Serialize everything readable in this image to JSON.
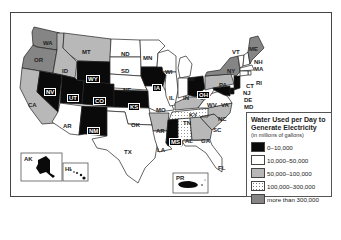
{
  "legend": {
    "title": "Water Used per Day to Generate Electricity",
    "title_line1": "Water Used per Day to",
    "title_line2": "Generate Electricity",
    "subtitle": "(in millions of gallons)",
    "categories": [
      {
        "label": "0–10,000",
        "color": "#0a0a0a"
      },
      {
        "label": "10,000–50,000",
        "color": "#ffffff"
      },
      {
        "label": "50,000–100,000",
        "color": "#b8b8b8"
      },
      {
        "label": "100,000–300,000",
        "color": "dotted"
      },
      {
        "label": "more than 300,000",
        "color": "#858585"
      }
    ]
  },
  "states": {
    "WA": {
      "label": "WA",
      "category": 4
    },
    "OR": {
      "label": "OR",
      "category": 4
    },
    "CA": {
      "label": "CA",
      "category": 2
    },
    "ID": {
      "label": "ID",
      "category": 2
    },
    "MT": {
      "label": "MT",
      "category": 2
    },
    "NV": {
      "label": "NV",
      "category": 0
    },
    "UT": {
      "label": "UT",
      "category": 0
    },
    "WY": {
      "label": "WY",
      "category": 0
    },
    "CO": {
      "label": "CO",
      "category": 0
    },
    "AZ": {
      "label": "AR",
      "category": 1
    },
    "NM": {
      "label": "NM",
      "category": 0
    },
    "ND": {
      "label": "ND",
      "category": 1
    },
    "SD": {
      "label": "SD",
      "category": 1
    },
    "NE": {
      "label": "NE",
      "category": 1
    },
    "KS": {
      "label": "KS",
      "category": 0
    },
    "OK": {
      "label": "OK",
      "category": 1
    },
    "TX": {
      "label": "TX",
      "category": 1
    },
    "MN": {
      "label": "MN",
      "category": 1
    },
    "IA": {
      "label": "IA",
      "category": 0
    },
    "MO": {
      "label": "MO",
      "category": 1
    },
    "AR": {
      "label": "AR",
      "category": 2
    },
    "LA": {
      "label": "LA",
      "category": 1
    },
    "WI": {
      "label": "WI",
      "category": 1
    },
    "IL": {
      "label": "IL",
      "category": 1
    },
    "MI": {
      "label": "MI",
      "category": 1
    },
    "IN": {
      "label": "IN",
      "category": 1
    },
    "OH": {
      "label": "OH",
      "category": 0
    },
    "KY": {
      "label": "KY",
      "category": 2
    },
    "TN": {
      "label": "TN",
      "category": 3
    },
    "MS": {
      "label": "MS",
      "category": 0
    },
    "AL": {
      "label": "AL",
      "category": 3
    },
    "GA": {
      "label": "GA",
      "category": 2
    },
    "FL": {
      "label": "FL",
      "category": 1
    },
    "SC": {
      "label": "SC",
      "category": 2
    },
    "NC": {
      "label": "NC",
      "category": 2
    },
    "VA": {
      "label": "VA",
      "category": 1
    },
    "WV": {
      "label": "WV",
      "category": 1
    },
    "PA": {
      "label": "PA",
      "category": 2
    },
    "NY": {
      "label": "NY",
      "category": 4
    },
    "VT": {
      "label": "VT",
      "category": 1
    },
    "NH": {
      "label": "NH",
      "category": 1
    },
    "ME": {
      "label": "ME",
      "category": 4
    },
    "MA": {
      "label": "MA",
      "category": 1
    },
    "RI": {
      "label": "RI",
      "category": 1
    },
    "CT": {
      "label": "CT",
      "category": 1
    },
    "NJ": {
      "label": "NJ",
      "category": 0
    },
    "DE": {
      "label": "DE",
      "category": 0
    },
    "MD": {
      "label": "MD",
      "category": 0
    },
    "AK": {
      "label": "AK",
      "category": 0
    },
    "HI": {
      "label": "HI",
      "category": 1
    },
    "PR": {
      "label": "PR",
      "category": 0
    }
  }
}
